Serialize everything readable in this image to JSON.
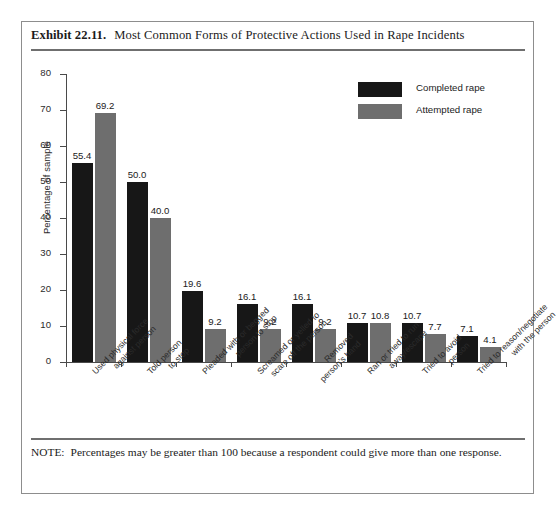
{
  "exhibit": {
    "number": "Exhibit 22.11.",
    "title": "Most Common Forms of Protective Actions Used in Rape Incidents",
    "note_label": "NOTE:",
    "note_text": "Percentages may be greater than 100 because a respondent could give more than one response."
  },
  "chart_data": {
    "type": "bar",
    "title": "Most Common Forms of Protective Actions Used in Rape Incidents",
    "xlabel": "",
    "ylabel": "Percentage of sample",
    "ylim": [
      0,
      80
    ],
    "yticks": [
      "0",
      "10",
      "20",
      "30",
      "40",
      "50",
      "60",
      "70",
      "80"
    ],
    "grid": false,
    "legend_position": "top-right",
    "categories": [
      "Used physical force\nagainst person",
      "Told person\nto stop",
      "Pleaded with or begged\nperson to stop",
      "Screamed or yelled to\nscare off the person",
      "Removed\nperson's hand",
      "Ran or tried to run\naway/escape",
      "Tried to avoid\nperson",
      "Tried to reason/negotiate\nwith the person"
    ],
    "series": [
      {
        "name": "Completed rape",
        "color": "#171717",
        "values": [
          55.4,
          50.0,
          19.6,
          16.1,
          16.1,
          10.7,
          10.7,
          7.1
        ],
        "labels": [
          "55.4",
          "50.0",
          "19.6",
          "16.1",
          "16.1",
          "10.7",
          "10.7",
          "7.1"
        ]
      },
      {
        "name": "Attempted rape",
        "color": "#6e6e6e",
        "values": [
          69.2,
          40.0,
          9.2,
          9.2,
          9.2,
          10.8,
          7.7,
          4.1
        ],
        "labels": [
          "69.2",
          "40.0",
          "9.2",
          "9.2",
          "9.2",
          "10.8",
          "7.7",
          "4.1"
        ]
      }
    ]
  }
}
